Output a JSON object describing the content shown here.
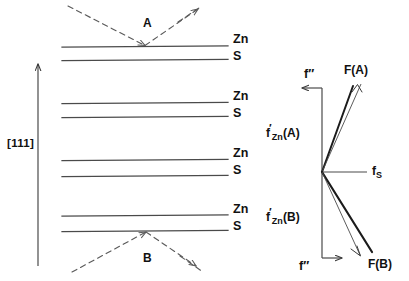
{
  "figure": {
    "line_color": "#4a4a4a",
    "dash_color": "#555555",
    "text_color": "#111111"
  },
  "left_panel": {
    "direction_label": "[111]",
    "diffraction_points": [
      {
        "id": "A",
        "label": "A"
      },
      {
        "id": "B",
        "label": "B"
      }
    ],
    "layer_labels": [
      {
        "zn": "Zn",
        "s": "S"
      },
      {
        "zn": "Zn",
        "s": "S"
      },
      {
        "zn": "Zn",
        "s": "S"
      },
      {
        "zn": "Zn",
        "s": "S"
      }
    ],
    "lattice_lines_y": [
      47,
      60,
      103,
      117,
      160,
      176,
      215,
      231
    ],
    "arrow_axis": {
      "x": 38,
      "y_top": 62,
      "y_bottom": 265
    }
  },
  "right_panel": {
    "origin": {
      "x": 322,
      "y": 172
    },
    "vectors": [
      {
        "name": "f-double-prime-top",
        "label": "f″",
        "direction": "left"
      },
      {
        "name": "f-double-prime-bottom",
        "label": "f″",
        "direction": "right"
      },
      {
        "name": "f-s",
        "label_base": "f",
        "label_sub": "S",
        "direction": "right"
      },
      {
        "name": "resultant-a",
        "label": "F(A)",
        "direction": "up-right"
      },
      {
        "name": "resultant-b",
        "label": "F(B)",
        "direction": "down-right"
      }
    ],
    "f_zn_a": {
      "base": "f",
      "prime": "′",
      "sub": "Zn",
      "arg": "(A)"
    },
    "f_zn_b": {
      "base": "f",
      "prime": "′",
      "sub": "Zn",
      "arg": "(B)"
    },
    "f_s": {
      "base": "f",
      "sub": "S"
    },
    "label_fa": "F(A)",
    "label_fb": "F(B)",
    "label_fpp_top": "f″",
    "label_fpp_bottom": "f″"
  }
}
